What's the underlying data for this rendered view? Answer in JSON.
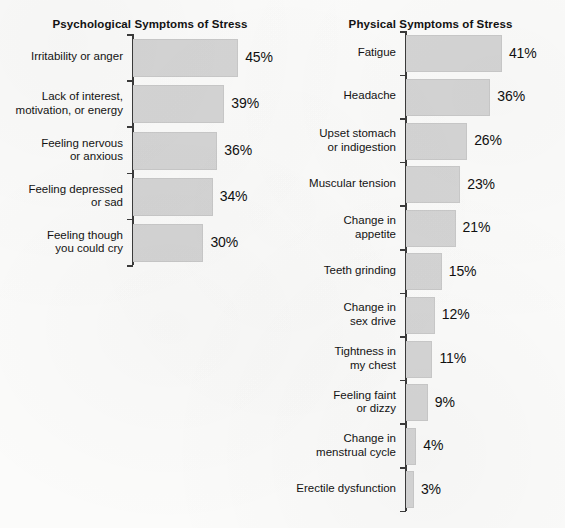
{
  "page": {
    "background_color": "#fbfbfa",
    "bar_color": "#d5d5d5",
    "axis_color": "#3b3b3b",
    "text_color": "#131313"
  },
  "chart_data": [
    {
      "type": "bar",
      "orientation": "horizontal",
      "title": "Psychological Symptoms of Stress",
      "xlabel": "",
      "ylabel": "",
      "xlim": [
        0,
        45
      ],
      "grid": false,
      "legend": "none",
      "value_suffix": "%",
      "categories": [
        "Irritability or anger",
        "Lack of interest,\nmotivation, or energy",
        "Feeling nervous\nor anxious",
        "Feeling depressed\nor sad",
        "Feeling though\nyou could cry"
      ],
      "values": [
        45,
        39,
        36,
        34,
        30
      ],
      "value_labels": [
        "45%",
        "39%",
        "36%",
        "34%",
        "30%"
      ]
    },
    {
      "type": "bar",
      "orientation": "horizontal",
      "title": "Physical Symptoms of Stress",
      "xlabel": "",
      "ylabel": "",
      "xlim": [
        0,
        41
      ],
      "grid": false,
      "legend": "none",
      "value_suffix": "%",
      "categories": [
        "Fatigue",
        "Headache",
        "Upset stomach\nor indigestion",
        "Muscular tension",
        "Change in\nappetite",
        "Teeth grinding",
        "Change in\nsex drive",
        "Tightness in\nmy chest",
        "Feeling faint\nor dizzy",
        "Change in\nmenstrual cycle",
        "Erectile dysfunction"
      ],
      "values": [
        41,
        36,
        26,
        23,
        21,
        15,
        12,
        11,
        9,
        4,
        3
      ],
      "value_labels": [
        "41%",
        "36%",
        "26%",
        "23%",
        "21%",
        "15%",
        "12%",
        "11%",
        "9%",
        "4%",
        "3%"
      ]
    }
  ]
}
